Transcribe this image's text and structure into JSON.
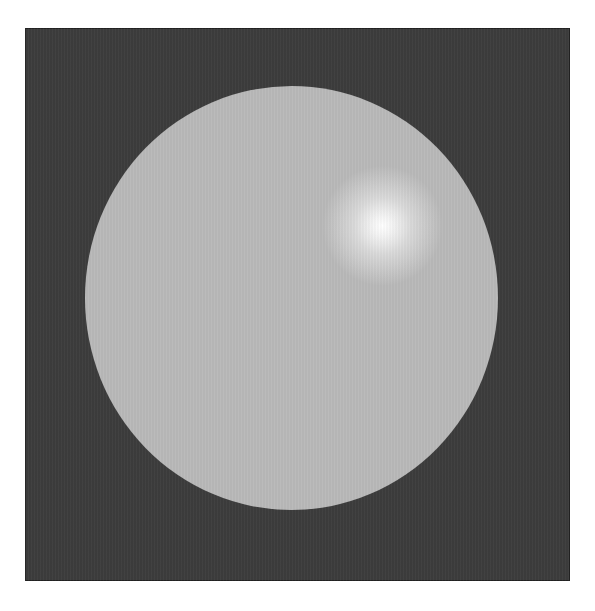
{
  "scene": {
    "description": "rendered shaded sphere with specular highlight on dark background",
    "background_color": "#3d3d3d",
    "sphere_color": "#b9b9b9",
    "highlight_color": "#ffffff",
    "frame_color": "#ffffff"
  }
}
